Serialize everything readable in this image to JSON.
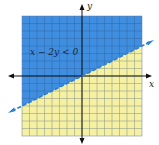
{
  "chart_data": {
    "type": "area",
    "title": "",
    "inequality": "x − 2y < 0",
    "boundary_line": {
      "equation": "x − 2y = 0",
      "slope": 0.5,
      "intercept": 0,
      "style": "dashed"
    },
    "shaded_region": "above boundary line",
    "xlabel": "x",
    "ylabel": "y",
    "xlim": [
      -8,
      8
    ],
    "ylim": [
      -8,
      8
    ],
    "grid": true,
    "legend": "none",
    "colors": {
      "solution": "#3f8ee0",
      "non_solution": "#f6f0a2",
      "grid": "#2a4a7a",
      "line": "#2a7fd8"
    }
  },
  "labels": {
    "inequality": "x − 2y < 0",
    "x_axis": "x",
    "y_axis": "y"
  }
}
